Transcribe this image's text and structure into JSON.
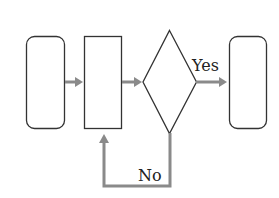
{
  "diagram": {
    "type": "flowchart",
    "colors": {
      "node_stroke": "#333333",
      "arrow": "#8a8a8a",
      "background": "#ffffff",
      "text": "#222222"
    },
    "nodes": [
      {
        "id": "start",
        "shape": "rounded-rectangle",
        "label": ""
      },
      {
        "id": "process",
        "shape": "rectangle",
        "label": ""
      },
      {
        "id": "decision",
        "shape": "diamond",
        "label": ""
      },
      {
        "id": "end",
        "shape": "rounded-rectangle",
        "label": ""
      }
    ],
    "edges": [
      {
        "from": "start",
        "to": "process",
        "label": ""
      },
      {
        "from": "process",
        "to": "decision",
        "label": ""
      },
      {
        "from": "decision",
        "to": "end",
        "label": "Yes"
      },
      {
        "from": "decision",
        "to": "process",
        "label": "No"
      }
    ],
    "labels": {
      "yes": "Yes",
      "no": "No"
    }
  }
}
